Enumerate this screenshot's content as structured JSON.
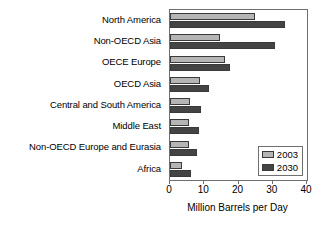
{
  "chart_data": {
    "type": "bar",
    "orientation": "horizontal",
    "title": "",
    "xlabel": "Million Barrels per Day",
    "ylabel": "",
    "xlim": [
      0,
      40
    ],
    "xticks": [
      0,
      10,
      20,
      30,
      40
    ],
    "xticklabels": [
      "0",
      "10",
      "20",
      "30",
      "40"
    ],
    "grid": false,
    "legend_position": "lower-right-inside",
    "categories": [
      "North America",
      "Non-OECD Asia",
      "OECE Europe",
      "OECD Asia",
      "Central and South America",
      "Middle East",
      "Non-OECD Europe and Eurasia",
      "Africa"
    ],
    "series": [
      {
        "name": "2003",
        "color": "#b5b5b5",
        "values": [
          24.7,
          14.6,
          16.1,
          8.8,
          5.8,
          5.5,
          5.5,
          3.5
        ]
      },
      {
        "name": "2030",
        "color": "#444444",
        "values": [
          33.6,
          30.7,
          17.5,
          11.5,
          9.0,
          8.5,
          8.0,
          6.0
        ]
      }
    ]
  },
  "legend": {
    "entries": [
      {
        "label": "2003"
      },
      {
        "label": "2030"
      }
    ]
  }
}
